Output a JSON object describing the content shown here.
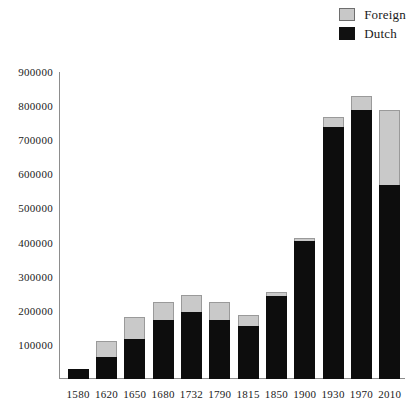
{
  "legend": {
    "position": "top-right",
    "entries": [
      {
        "label": "Foreign",
        "color": "#c9c9c9",
        "icon": "legend-swatch-foreign"
      },
      {
        "label": "Dutch",
        "color": "#0d0d0d",
        "icon": "legend-swatch-dutch"
      }
    ]
  },
  "axis": {
    "y_ticks": [
      "900000",
      "800000",
      "700000",
      "600000",
      "500000",
      "400000",
      "300000",
      "200000",
      "100000"
    ],
    "x_ticks": [
      "1580",
      "1620",
      "1650",
      "1680",
      "1732",
      "1790",
      "1815",
      "1850",
      "1900",
      "1930",
      "1970",
      "2010"
    ]
  },
  "chart_data": {
    "type": "bar",
    "stacked": true,
    "title": "",
    "subtitle": "",
    "xlabel": "",
    "ylabel": "",
    "ylim": [
      0,
      900000
    ],
    "ytick_step": 100000,
    "grid": false,
    "legend_position": "top-right",
    "categories": [
      "1580",
      "1620",
      "1650",
      "1680",
      "1732",
      "1790",
      "1815",
      "1850",
      "1900",
      "1930",
      "1970",
      "2010"
    ],
    "series": [
      {
        "name": "Dutch",
        "color": "#0d0d0d",
        "values": [
          30000,
          65000,
          117000,
          172000,
          195000,
          172000,
          155000,
          242000,
          405000,
          738000,
          790000,
          570000
        ]
      },
      {
        "name": "Foreign",
        "color": "#c9c9c9",
        "values": [
          0,
          45000,
          65000,
          53000,
          52000,
          53000,
          33000,
          13000,
          8000,
          30000,
          40000,
          218000
        ]
      }
    ],
    "totals": [
      30000,
      110000,
      182000,
      225000,
      247000,
      225000,
      188000,
      255000,
      413000,
      768000,
      830000,
      788000
    ]
  }
}
